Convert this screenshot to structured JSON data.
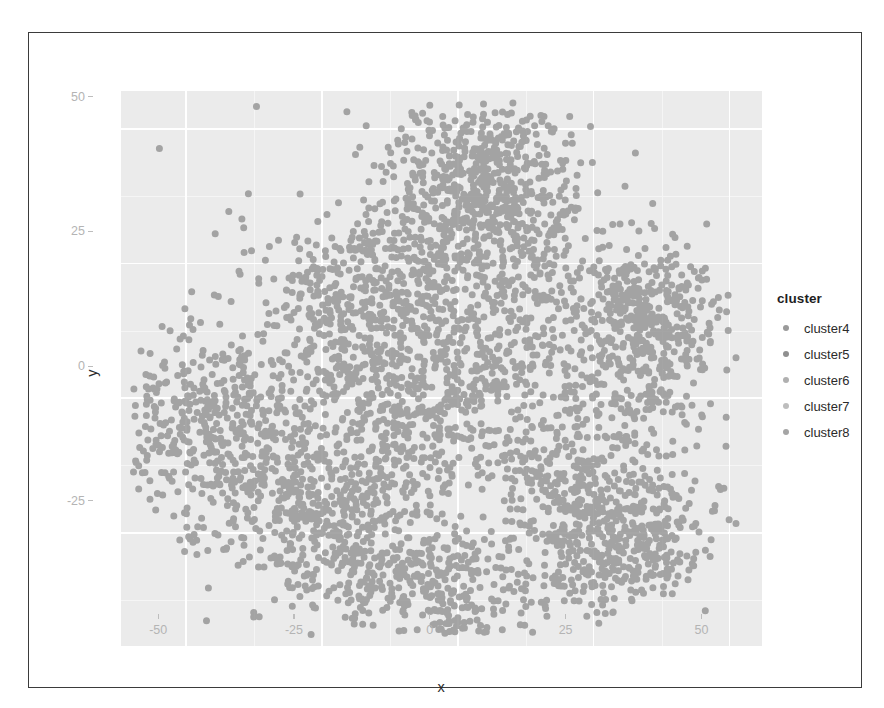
{
  "figure": {
    "background": "#ffffff",
    "frame_color": "#3b3b3b",
    "panel_background": "#ebebeb",
    "gridline_color": "#ffffff"
  },
  "chart_data": {
    "type": "scatter",
    "title": "",
    "subtitle": "",
    "xlabel": "x",
    "ylabel": "y",
    "xlim": [
      -62,
      56
    ],
    "ylim": [
      -46,
      57
    ],
    "xticks": [
      -50,
      -25,
      0,
      25,
      50
    ],
    "xticklabels": [
      "-50",
      "-25",
      "0",
      "25",
      "50"
    ],
    "yticks": [
      -25,
      0,
      25,
      50
    ],
    "yticklabels": [
      "-25",
      "0",
      "25",
      "50"
    ],
    "grid": true,
    "grid_style": "white major and minor gridlines on gray panel",
    "point_color": "#969696",
    "point_size_px": 7,
    "point_opacity": 0.85,
    "approx_point_count": 3000,
    "legend": {
      "position": "right",
      "title": "cluster",
      "entries": [
        {
          "label": "cluster4",
          "color": "#9a9a9a"
        },
        {
          "label": "cluster5",
          "color": "#8f8f8f"
        },
        {
          "label": "cluster6",
          "color": "#b0b0b0"
        },
        {
          "label": "cluster7",
          "color": "#bdbdbd"
        },
        {
          "label": "cluster8",
          "color": "#a5a5a5"
        }
      ]
    },
    "clusters": [
      {
        "name": "cluster4",
        "center": [
          -2,
          30
        ],
        "n": 620,
        "spread": [
          13,
          12
        ]
      },
      {
        "name": "cluster5",
        "center": [
          -3,
          2
        ],
        "n": 820,
        "spread": [
          15,
          14
        ]
      },
      {
        "name": "cluster6",
        "center": [
          -38,
          -7
        ],
        "n": 430,
        "spread": [
          11,
          13
        ]
      },
      {
        "name": "cluster7",
        "center": [
          31,
          -4
        ],
        "n": 560,
        "spread": [
          9,
          17
        ]
      },
      {
        "name": "cluster8",
        "center": [
          -10,
          -28
        ],
        "n": 570,
        "spread": [
          17,
          10
        ]
      }
    ]
  }
}
